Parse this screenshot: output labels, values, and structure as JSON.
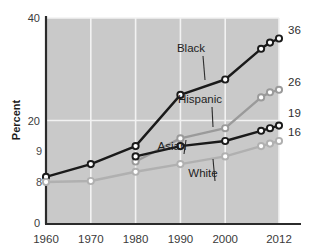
{
  "chart_data": {
    "type": "line",
    "title": "",
    "xlabel": "",
    "ylabel": "Percent",
    "xlim": [
      1960,
      2012
    ],
    "ylim": [
      0,
      40
    ],
    "grid": true,
    "legend_position": "inline-annotations",
    "x_ticks": [
      "1960",
      "1970",
      "1980",
      "1990",
      "2000",
      "2012"
    ],
    "x_tick_values": [
      1960,
      1970,
      1980,
      1990,
      2000,
      2012
    ],
    "y_ticks": [
      "0",
      "20",
      "40"
    ],
    "y_tick_values": [
      0,
      20,
      40
    ],
    "series": [
      {
        "name": "Black",
        "color": "#1a1a1a",
        "marker": "open-circle",
        "x": [
          1960,
          1970,
          1980,
          1990,
          2000,
          2008,
          2010,
          2012
        ],
        "values": [
          9,
          11.5,
          15,
          25,
          28,
          34,
          35.2,
          36
        ],
        "start_label": "9",
        "end_label": "36"
      },
      {
        "name": "Hispanic",
        "color": "#9a9a9a",
        "marker": "open-circle",
        "x": [
          1980,
          1990,
          2000,
          2008,
          2010,
          2012
        ],
        "values": [
          12,
          16.5,
          18.5,
          24.5,
          25.5,
          26
        ],
        "start_label": "",
        "end_label": "26"
      },
      {
        "name": "Asian",
        "color": "#1a1a1a",
        "marker": "open-circle",
        "x": [
          1980,
          1990,
          2000,
          2008,
          2010,
          2012
        ],
        "values": [
          13,
          15,
          16,
          18,
          18.5,
          19
        ],
        "start_label": "",
        "end_label": "19"
      },
      {
        "name": "White",
        "color": "#b0b0b0",
        "marker": "open-circle",
        "x": [
          1960,
          1970,
          1980,
          1990,
          2000,
          2008,
          2010,
          2012
        ],
        "values": [
          8,
          8.2,
          10,
          11.5,
          13,
          15,
          15.5,
          16
        ],
        "start_label": "8",
        "end_label": "16"
      }
    ],
    "annotations": [
      {
        "text": "Black",
        "label_x": 191,
        "label_y": 52,
        "line_to_x": 205,
        "line_to_y": 80
      },
      {
        "text": "Hispanic",
        "label_x": 200,
        "label_y": 103,
        "line_to_x": 213,
        "line_to_y": 127
      },
      {
        "text": "Asian",
        "label_x": 172,
        "label_y": 150,
        "line_to_x": 186,
        "line_to_y": 140
      },
      {
        "text": "White",
        "label_x": 203,
        "label_y": 177,
        "line_to_x": 213,
        "line_to_y": 159
      }
    ],
    "end_labels": [
      {
        "text": "36",
        "x": 288,
        "y": 34
      },
      {
        "text": "26",
        "x": 288,
        "y": 86
      },
      {
        "text": "19",
        "x": 288,
        "y": 117
      },
      {
        "text": "16",
        "x": 288,
        "y": 136
      }
    ],
    "start_labels": [
      {
        "text": "9",
        "x": 36,
        "y": 155
      },
      {
        "text": "8",
        "x": 36,
        "y": 186
      }
    ],
    "plot_background": "#c9c9c9",
    "gridline_color": "#f2f2f2",
    "axis_color": "#2b2b2b"
  }
}
